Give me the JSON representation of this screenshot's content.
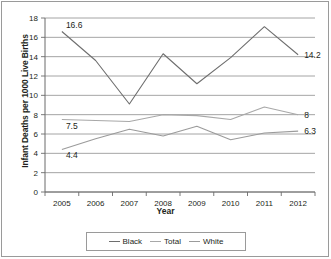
{
  "chart_data": {
    "type": "line",
    "title": "",
    "xlabel": "Year",
    "ylabel": "Infant Deaths per 1000 Live Births",
    "categories": [
      "2005",
      "2006",
      "2007",
      "2008",
      "2009",
      "2010",
      "2011",
      "2012"
    ],
    "x": [
      2005,
      2006,
      2007,
      2008,
      2009,
      2010,
      2011,
      2012
    ],
    "ylim": [
      0,
      18
    ],
    "yticks": [
      0,
      2,
      4,
      6,
      8,
      10,
      12,
      14,
      16,
      18
    ],
    "ytick_labels": [
      "0",
      "2",
      "4",
      "6",
      "8",
      "10",
      "12",
      "14",
      "16",
      "18"
    ],
    "grid": "horizontal",
    "legend_position": "bottom",
    "series": [
      {
        "name": "Black",
        "color": "#6e6e6e",
        "values": [
          16.6,
          13.6,
          9.1,
          14.3,
          11.2,
          13.9,
          17.1,
          14.2
        ]
      },
      {
        "name": "Total",
        "color": "#a8a8a8",
        "values": [
          7.5,
          7.4,
          7.3,
          8.0,
          7.9,
          7.5,
          8.8,
          8.0
        ]
      },
      {
        "name": "White",
        "color": "#9b9b9b",
        "values": [
          4.4,
          5.5,
          6.5,
          5.8,
          6.8,
          5.4,
          6.1,
          6.3
        ]
      }
    ],
    "annotations": [
      {
        "text": "16.6",
        "series": "Black",
        "x": 2005,
        "value": 16.6
      },
      {
        "text": "14.2",
        "series": "Black",
        "x": 2012,
        "value": 14.2
      },
      {
        "text": "7.5",
        "series": "Total",
        "x": 2005,
        "value": 7.5
      },
      {
        "text": "8",
        "series": "Total",
        "x": 2012,
        "value": 8.0
      },
      {
        "text": "4.4",
        "series": "White",
        "x": 2005,
        "value": 4.4
      },
      {
        "text": "6.3",
        "series": "White",
        "x": 2012,
        "value": 6.3
      }
    ]
  },
  "legend": {
    "items": [
      {
        "label": "Black",
        "color": "#6e6e6e"
      },
      {
        "label": "Total",
        "color": "#a8a8a8"
      },
      {
        "label": "White",
        "color": "#9b9b9b"
      }
    ]
  },
  "axes": {
    "x_title": "Year",
    "y_title": "Infant Deaths per 1000 Live Births"
  },
  "colors": {
    "axis": "#6b6b6b",
    "grid": "#8d8d8d",
    "frame": "#9a9a9a",
    "text": "#231f20"
  }
}
